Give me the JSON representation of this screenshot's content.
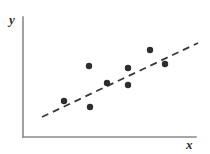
{
  "figure": {
    "background_color": "#ffffff",
    "width": 210,
    "height": 154
  },
  "axes": {
    "color": "#8a8a8a",
    "stroke_width": 1.6,
    "origin_x": 23,
    "origin_y": 137,
    "y_axis_top": 17,
    "x_axis_right": 196,
    "y_label": "y",
    "x_label": "x",
    "label_color": "#2b2b2b"
  },
  "chart_data": {
    "type": "scatter",
    "title": "",
    "subtitle": "",
    "xlabel": "x",
    "ylabel": "y",
    "grid": false,
    "legend": null,
    "xlim": [
      0,
      10
    ],
    "ylim": [
      0,
      10
    ],
    "axis_ticks": {
      "x": [],
      "y": []
    },
    "marker": {
      "shape": "circle",
      "color": "#2e2e2e",
      "size_px": 6.4
    },
    "points": [
      {
        "px": 64,
        "py": 101,
        "x": 2.37,
        "y": 3.0
      },
      {
        "px": 89,
        "py": 66,
        "x": 3.82,
        "y": 5.92
      },
      {
        "px": 90,
        "py": 107,
        "x": 3.87,
        "y": 2.5
      },
      {
        "px": 107,
        "py": 83,
        "x": 4.85,
        "y": 4.5
      },
      {
        "px": 128,
        "py": 68,
        "x": 6.07,
        "y": 5.75
      },
      {
        "px": 128,
        "py": 85,
        "x": 6.07,
        "y": 4.33
      },
      {
        "px": 150,
        "py": 50,
        "x": 7.34,
        "y": 7.25
      },
      {
        "px": 165,
        "py": 64,
        "x": 8.21,
        "y": 6.08
      }
    ],
    "trend_line": {
      "style": "dashed",
      "color": "#3a3a3a",
      "stroke_width": 1.8,
      "dash_pattern": "7 5",
      "x1_px": 42,
      "y1_px": 117,
      "x2_px": 198,
      "y2_px": 43,
      "slope_estimate": 0.62,
      "description": "upward sloping dashed regression line"
    }
  }
}
